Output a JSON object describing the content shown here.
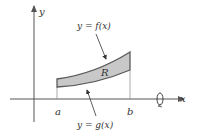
{
  "diagram": {
    "axes": {
      "x_label": "x",
      "y_label": "y"
    },
    "curves": {
      "upper_label": "y = f(x)",
      "lower_label": "y = g(x)"
    },
    "region_label": "R",
    "bounds": {
      "left": "a",
      "right": "b"
    },
    "rotation_axis": "x-axis",
    "colors": {
      "region_fill": "#c8c8c8",
      "region_stroke": "#5a5a5a",
      "axis": "#555555",
      "text": "#333333"
    }
  }
}
